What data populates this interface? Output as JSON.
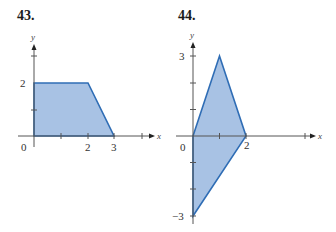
{
  "problems": [
    {
      "number": "43.",
      "axes": {
        "x_label": "x",
        "y_label": "y"
      },
      "tick_labels": {
        "origin": "0",
        "x": [
          "2",
          "3"
        ],
        "y": [
          "2"
        ]
      },
      "region_vertices": [
        [
          0,
          0
        ],
        [
          0,
          2
        ],
        [
          2,
          2
        ],
        [
          3,
          0
        ]
      ]
    },
    {
      "number": "44.",
      "axes": {
        "x_label": "x",
        "y_label": "y"
      },
      "tick_labels": {
        "origin": "0",
        "x": [
          "2"
        ],
        "y": [
          "3",
          "−3"
        ]
      },
      "region_vertices": [
        [
          0,
          0
        ],
        [
          1,
          3
        ],
        [
          2,
          0
        ],
        [
          0,
          -3
        ]
      ]
    }
  ],
  "colors": {
    "fill": "#a8c2e4",
    "outline": "#2f6db5",
    "axis": "#555555"
  }
}
